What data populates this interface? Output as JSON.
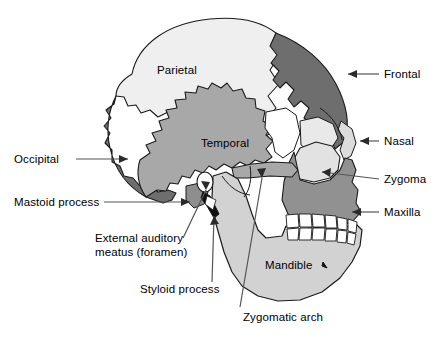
{
  "figure": {
    "background_color": "#ffffff",
    "line_color": "#000000",
    "leader_color": "#555555"
  },
  "palette": {
    "parietal_fill": "#efefef",
    "frontal_fill": "#6e6e6e",
    "occipital_fill": "#6e6e6e",
    "temporal_fill": "#a8a8a8",
    "maxilla_fill": "#919191",
    "mandible_fill": "#d2d2d2",
    "zygoma_fill": "#e2e2e2",
    "nasal_fill": "#dcdcdc",
    "tooth_fill": "#ffffff",
    "sphenoid_fill": "#ffffff",
    "styloid_fill": "#111111"
  },
  "labels": [
    {
      "id": "parietal",
      "text": "Parietal",
      "x": 157,
      "y": 65,
      "side": "interior"
    },
    {
      "id": "temporal",
      "text": "Temporal",
      "x": 201,
      "y": 138,
      "side": "interior"
    },
    {
      "id": "mandible",
      "text": "Mandible",
      "x": 265,
      "y": 260,
      "side": "interior"
    },
    {
      "id": "frontal",
      "text": "Frontal",
      "x": 385,
      "y": 68,
      "side": "right"
    },
    {
      "id": "nasal",
      "text": "Nasal",
      "x": 385,
      "y": 135,
      "side": "right"
    },
    {
      "id": "zygoma",
      "text": "Zygoma",
      "x": 385,
      "y": 173,
      "side": "right"
    },
    {
      "id": "maxilla",
      "text": "Maxilla",
      "x": 385,
      "y": 206,
      "side": "right"
    },
    {
      "id": "occipital",
      "text": "Occipital",
      "x": 14,
      "y": 153,
      "side": "left"
    },
    {
      "id": "mastoid",
      "text": "Mastoid process",
      "x": 14,
      "y": 196,
      "side": "left"
    },
    {
      "id": "eam",
      "text": "External auditory\nmeatus (foramen)",
      "x": 95,
      "y": 233,
      "side": "left"
    },
    {
      "id": "styloid",
      "text": "Styloid process",
      "x": 140,
      "y": 283,
      "side": "left"
    },
    {
      "id": "zyg_arch",
      "text": "Zygomatic arch",
      "x": 243,
      "y": 312,
      "side": "bottom"
    }
  ],
  "bones": [
    {
      "id": "parietal",
      "name": "Parietal bone"
    },
    {
      "id": "frontal",
      "name": "Frontal bone"
    },
    {
      "id": "occipital",
      "name": "Occipital bone"
    },
    {
      "id": "temporal",
      "name": "Temporal bone"
    },
    {
      "id": "maxilla",
      "name": "Maxilla"
    },
    {
      "id": "mandible",
      "name": "Mandible"
    },
    {
      "id": "zygoma",
      "name": "Zygomatic bone"
    },
    {
      "id": "nasal",
      "name": "Nasal bone"
    },
    {
      "id": "styloid",
      "name": "Styloid process"
    },
    {
      "id": "mastoid",
      "name": "Mastoid process"
    },
    {
      "id": "eam",
      "name": "External auditory meatus"
    },
    {
      "id": "zyg_arch",
      "name": "Zygomatic arch"
    },
    {
      "id": "teeth",
      "name": "Teeth"
    }
  ]
}
